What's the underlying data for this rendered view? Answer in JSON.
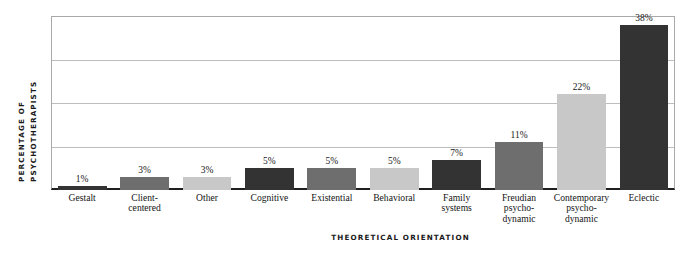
{
  "chart_data": {
    "type": "bar",
    "title": "",
    "xlabel": "THEORETICAL ORIENTATION",
    "ylabel_line1": "PERCENTAGE OF",
    "ylabel_line2": "PSYCHOTHERAPISTS",
    "ylim": [
      0,
      40
    ],
    "grid": true,
    "gridline_values": [
      10,
      20,
      30,
      40
    ],
    "legend": "none",
    "categories": [
      "Gestalt",
      "Client-centered",
      "Other",
      "Cognitive",
      "Existential",
      "Behavioral",
      "Family systems",
      "Freudian psychodynamic",
      "Contemporary psychodynamic",
      "Eclectic"
    ],
    "category_lines": [
      [
        "Gestalt"
      ],
      [
        "Client-",
        "centered"
      ],
      [
        "Other"
      ],
      [
        "Cognitive"
      ],
      [
        "Existential"
      ],
      [
        "Behavioral"
      ],
      [
        "Family",
        "systems"
      ],
      [
        "Freudian",
        "psycho-",
        "dynamic"
      ],
      [
        "Contemporary",
        "psycho-",
        "dynamic"
      ],
      [
        "Eclectic"
      ]
    ],
    "values": [
      1,
      3,
      3,
      5,
      5,
      5,
      7,
      11,
      22,
      38
    ],
    "value_labels": [
      "1%",
      "3%",
      "3%",
      "5%",
      "5%",
      "5%",
      "7%",
      "11%",
      "22%",
      "38%"
    ],
    "bar_colors": [
      "#333333",
      "#6e6e6e",
      "#c8c8c8",
      "#333333",
      "#6e6e6e",
      "#c8c8c8",
      "#333333",
      "#6e6e6e",
      "#c8c8c8",
      "#333333"
    ]
  },
  "colors": {
    "dark": "#333333",
    "medium": "#6e6e6e",
    "light": "#c8c8c8",
    "gridline": "#bdbdbd",
    "axis": "#1f1f1f",
    "frame": "#a9a9a9",
    "text": "#141414",
    "background": "#ffffff"
  }
}
